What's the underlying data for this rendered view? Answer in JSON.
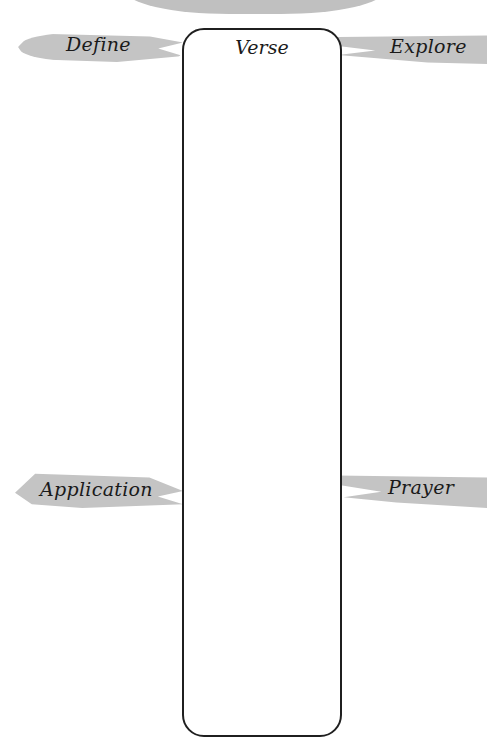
{
  "page": {
    "center_box": {
      "label": "Verse"
    },
    "labels": {
      "define": "Define",
      "explore": "Explore",
      "application": "Application",
      "prayer": "Prayer"
    },
    "colors": {
      "brush": "#c4c4c4",
      "border": "#1f1f1f"
    }
  }
}
